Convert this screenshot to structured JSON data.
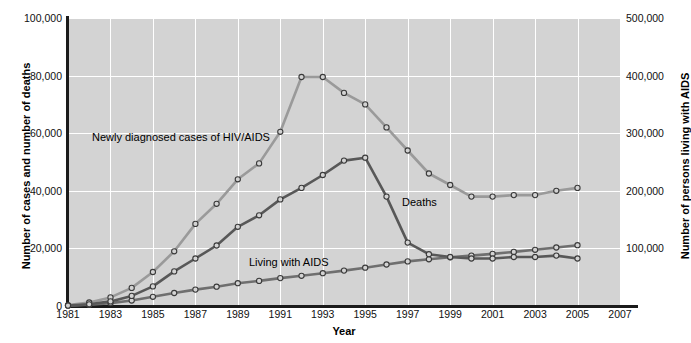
{
  "chart_data": {
    "type": "line",
    "title": "",
    "xlabel": "Year",
    "ylabel": "Number of cases and number of deaths",
    "ylabel_right": "Number of persons living with AIDS",
    "xlim": [
      1981,
      2007
    ],
    "ylim": [
      0,
      100000
    ],
    "ylim_right": [
      0,
      500000
    ],
    "grid": true,
    "legend_position": "inline-annotations",
    "x_tick_labels": [
      "1981",
      "1983",
      "1985",
      "1987",
      "1989",
      "1991",
      "1993",
      "1995",
      "1997",
      "1999",
      "2001",
      "2003",
      "2005",
      "2007"
    ],
    "y_tick_labels_left": [
      "0",
      "20,000",
      "40,000",
      "60,000",
      "80,000",
      "100,000"
    ],
    "y_tick_labels_right": [
      "0",
      "100,000",
      "200,000",
      "300,000",
      "400,000",
      "500,000"
    ],
    "y_tick_values_left": [
      0,
      20000,
      40000,
      60000,
      80000,
      100000
    ],
    "y_tick_values_right": [
      0,
      100000,
      200000,
      300000,
      400000,
      500000
    ],
    "x": [
      1981,
      1982,
      1983,
      1984,
      1985,
      1986,
      1987,
      1988,
      1989,
      1990,
      1991,
      1992,
      1993,
      1994,
      1995,
      1996,
      1997,
      1998,
      1999,
      2000,
      2001,
      2002,
      2003,
      2004,
      2005
    ],
    "series": [
      {
        "name": "Newly diagnosed cases of HIV/AIDS",
        "axis": "left",
        "color": "#9a9a9a",
        "marker": "open-circle",
        "values": [
          300,
          1200,
          3000,
          6300,
          11800,
          19000,
          28500,
          35500,
          44000,
          49500,
          60500,
          79500,
          79500,
          74000,
          70000,
          62000,
          54000,
          46000,
          42000,
          38000,
          38000,
          38500,
          38500,
          40000,
          41000
        ]
      },
      {
        "name": "Living with AIDS",
        "axis": "right",
        "color": "#6f6f6f",
        "marker": "open-circle",
        "values": [
          500,
          2000,
          5000,
          9500,
          16000,
          22500,
          28500,
          33500,
          39500,
          43500,
          48500,
          52500,
          57000,
          61500,
          66500,
          72000,
          77500,
          81000,
          84500,
          87500,
          90500,
          94000,
          97500,
          101500,
          105500
        ],
        "values_left_scale": [
          100,
          400,
          1000,
          1900,
          3200,
          4500,
          5700,
          6700,
          7900,
          8700,
          9700,
          10500,
          11400,
          12300,
          13300,
          14400,
          15500,
          16200,
          16900,
          17500,
          18100,
          18800,
          19500,
          20300,
          21100
        ],
        "values_right_scale": [
          500,
          2000,
          5000,
          9500,
          16000,
          22500,
          28500,
          33500,
          39500,
          43500,
          48500,
          52500,
          57000,
          61500,
          66500,
          72000,
          77500,
          81000,
          84500,
          87500,
          90500,
          94000,
          97500,
          101500,
          105500
        ]
      },
      {
        "name": "Deaths",
        "axis": "left",
        "color": "#585858",
        "marker": "open-circle",
        "values": [
          150,
          600,
          1600,
          3500,
          6800,
          12000,
          16500,
          21000,
          27500,
          31500,
          37000,
          41000,
          45500,
          50500,
          51500,
          38000,
          22000,
          18000,
          17000,
          16500,
          16500,
          17000,
          17000,
          17500,
          16500
        ]
      }
    ],
    "annotations": [
      {
        "text": "Newly diagnosed cases of HIV/AIDS",
        "x": 1982.5,
        "y": 58000
      },
      {
        "text": "Living with AIDS",
        "x": 1990.0,
        "y": 12000
      },
      {
        "text": "Deaths",
        "x": 1997.2,
        "y": 31000
      }
    ]
  },
  "axes": {
    "left_title": "Number of cases and number of deaths",
    "right_title": "Number of persons living with AIDS",
    "x_title": "Year"
  },
  "caption": {
    "text": ""
  },
  "colors": {
    "plot_background": "#d3d3d3",
    "gridline": "#ffffff",
    "axis": "#1b1b1b",
    "series_hiv": "#9a9a9a",
    "series_living": "#6f6f6f",
    "series_deaths": "#585858"
  }
}
